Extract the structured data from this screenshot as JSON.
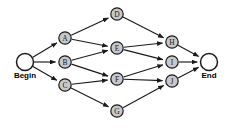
{
  "diagram": {
    "type": "directed-acyclic-graph",
    "background_color": "#ffffff",
    "node_fill_color": "#c8c8c8",
    "terminal_fill_color": "#ffffff",
    "stroke_color": "#1a1a1a",
    "start_label": "Begin",
    "end_label": "End",
    "nodes": [
      {
        "id": "begin",
        "label": "Begin",
        "kind": "terminal",
        "x": 25,
        "y": 62,
        "r": 8.5,
        "label_offset_y": 16
      },
      {
        "id": "A",
        "label": "A",
        "kind": "activity",
        "x": 65,
        "y": 38,
        "r": 6.2
      },
      {
        "id": "B",
        "label": "B",
        "kind": "activity",
        "x": 65,
        "y": 62,
        "r": 6.2
      },
      {
        "id": "C",
        "label": "C",
        "kind": "activity",
        "x": 65,
        "y": 85,
        "r": 6.2
      },
      {
        "id": "D",
        "label": "D",
        "kind": "activity",
        "x": 117,
        "y": 14,
        "r": 6.2
      },
      {
        "id": "E",
        "label": "E",
        "kind": "activity",
        "x": 117,
        "y": 48,
        "r": 6.2
      },
      {
        "id": "F",
        "label": "F",
        "kind": "activity",
        "x": 117,
        "y": 79,
        "r": 6.2
      },
      {
        "id": "G",
        "label": "G",
        "kind": "activity",
        "x": 117,
        "y": 111,
        "r": 6.2
      },
      {
        "id": "H",
        "label": "H",
        "kind": "activity",
        "x": 172,
        "y": 42,
        "r": 6.2
      },
      {
        "id": "I",
        "label": "I",
        "kind": "activity",
        "x": 172,
        "y": 62,
        "r": 6.2
      },
      {
        "id": "J",
        "label": "J",
        "kind": "activity",
        "x": 172,
        "y": 81,
        "r": 6.2
      },
      {
        "id": "end",
        "label": "End",
        "kind": "terminal",
        "x": 209,
        "y": 62,
        "r": 8.5,
        "label_offset_y": 16
      }
    ],
    "edges": [
      {
        "from": "begin",
        "to": "A"
      },
      {
        "from": "begin",
        "to": "B"
      },
      {
        "from": "begin",
        "to": "C"
      },
      {
        "from": "A",
        "to": "D"
      },
      {
        "from": "A",
        "to": "E"
      },
      {
        "from": "B",
        "to": "E"
      },
      {
        "from": "B",
        "to": "F"
      },
      {
        "from": "C",
        "to": "F"
      },
      {
        "from": "C",
        "to": "G"
      },
      {
        "from": "D",
        "to": "H"
      },
      {
        "from": "E",
        "to": "H"
      },
      {
        "from": "E",
        "to": "I"
      },
      {
        "from": "F",
        "to": "I"
      },
      {
        "from": "F",
        "to": "J"
      },
      {
        "from": "G",
        "to": "J"
      },
      {
        "from": "H",
        "to": "end"
      },
      {
        "from": "I",
        "to": "end"
      },
      {
        "from": "J",
        "to": "end"
      }
    ]
  }
}
